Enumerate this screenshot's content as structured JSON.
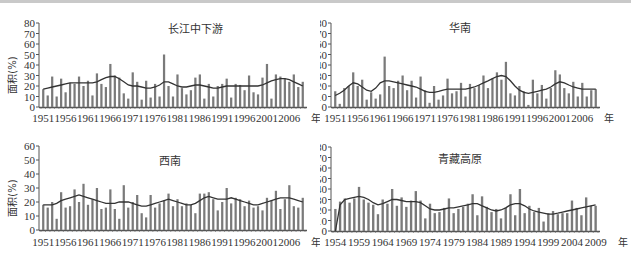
{
  "chart_data": [
    {
      "type": "bar",
      "title": "长江中下游",
      "ylabel": "面积(%)",
      "xlabel_suffix": "年",
      "ylim": [
        0,
        80
      ],
      "yticks": [
        0,
        10,
        20,
        30,
        40,
        50,
        60,
        70,
        80
      ],
      "x_start": 1951,
      "x_end": 2009,
      "xticks": [
        "1951",
        "1956",
        "1961",
        "1966",
        "1971",
        "1976",
        "1981",
        "1986",
        "1991",
        "1996",
        "2001",
        "2006"
      ],
      "values": [
        17,
        11,
        29,
        10,
        27,
        14,
        23,
        22,
        29,
        20,
        25,
        11,
        32,
        22,
        19,
        41,
        30,
        28,
        13,
        8,
        33,
        24,
        7,
        25,
        9,
        22,
        10,
        50,
        20,
        10,
        31,
        18,
        12,
        16,
        28,
        31,
        8,
        22,
        10,
        20,
        22,
        27,
        9,
        22,
        21,
        16,
        30,
        14,
        12,
        28,
        41,
        8,
        31,
        29,
        27,
        24,
        31,
        19,
        24
      ],
      "trend": [
        17,
        18,
        19,
        20,
        21,
        22,
        23,
        23,
        23,
        23,
        23,
        23,
        24,
        26,
        28,
        29,
        29,
        27,
        24,
        21,
        20,
        20,
        19,
        18,
        18,
        19,
        21,
        24,
        24,
        22,
        20,
        19,
        19,
        20,
        21,
        21,
        20,
        19,
        18,
        18,
        19,
        20,
        20,
        20,
        20,
        20,
        20,
        20,
        20,
        21,
        23,
        25,
        26,
        27,
        27,
        26,
        24,
        22,
        20
      ]
    },
    {
      "type": "bar",
      "title": "华南",
      "ylabel": "面积(%)",
      "xlabel_suffix": "年",
      "ylim": [
        0,
        80
      ],
      "yticks": [
        0,
        10,
        20,
        30,
        40,
        50,
        60,
        70,
        80
      ],
      "x_start": 1951,
      "x_end": 2009,
      "xticks": [
        "1951",
        "1956",
        "1961",
        "1966",
        "1971",
        "1976",
        "1981",
        "1986",
        "1991",
        "1996",
        "2001",
        "2006"
      ],
      "values": [
        15,
        3,
        18,
        20,
        33,
        20,
        26,
        7,
        14,
        8,
        12,
        48,
        20,
        18,
        25,
        30,
        16,
        25,
        9,
        29,
        16,
        4,
        20,
        7,
        11,
        27,
        13,
        15,
        23,
        10,
        22,
        18,
        21,
        30,
        18,
        27,
        33,
        26,
        43,
        13,
        11,
        20,
        15,
        2,
        26,
        13,
        21,
        8,
        18,
        35,
        31,
        18,
        13,
        24,
        10,
        23,
        10,
        16,
        17
      ],
      "trend": [
        11,
        13,
        16,
        20,
        23,
        22,
        19,
        16,
        15,
        18,
        23,
        25,
        25,
        24,
        23,
        22,
        21,
        20,
        19,
        17,
        15,
        14,
        14,
        15,
        16,
        17,
        17,
        17,
        17,
        17,
        18,
        19,
        21,
        23,
        25,
        27,
        29,
        30,
        29,
        25,
        20,
        16,
        14,
        13,
        14,
        15,
        16,
        17,
        19,
        22,
        24,
        23,
        21,
        19,
        18,
        17,
        17,
        17,
        17
      ]
    },
    {
      "type": "bar",
      "title": "西南",
      "ylabel": "面积(%)",
      "xlabel_suffix": "年",
      "ylim": [
        0,
        60
      ],
      "yticks": [
        0,
        10,
        20,
        30,
        40,
        50,
        60
      ],
      "x_start": 1951,
      "x_end": 2009,
      "xticks": [
        "1951",
        "1956",
        "1961",
        "1966",
        "1971",
        "1976",
        "1981",
        "1986",
        "1991",
        "1996",
        "2001",
        "2006"
      ],
      "values": [
        18,
        16,
        20,
        8,
        27,
        16,
        17,
        29,
        20,
        33,
        18,
        22,
        30,
        15,
        16,
        29,
        15,
        8,
        32,
        16,
        20,
        25,
        12,
        9,
        25,
        16,
        19,
        21,
        26,
        17,
        22,
        17,
        19,
        18,
        12,
        26,
        26,
        27,
        22,
        14,
        20,
        30,
        19,
        23,
        22,
        17,
        21,
        16,
        17,
        14,
        23,
        21,
        28,
        15,
        22,
        32,
        17,
        16,
        23
      ],
      "trend": [
        18,
        18,
        18,
        19,
        21,
        22,
        23,
        24,
        25,
        24,
        23,
        22,
        21,
        20,
        19,
        19,
        19,
        20,
        20,
        20,
        19,
        18,
        17,
        17,
        18,
        19,
        20,
        21,
        22,
        21,
        20,
        19,
        18,
        18,
        19,
        21,
        23,
        24,
        23,
        22,
        22,
        22,
        23,
        22,
        21,
        20,
        19,
        18,
        18,
        19,
        20,
        21,
        22,
        23,
        23,
        23,
        22,
        21,
        20
      ]
    },
    {
      "type": "bar",
      "title": "青藏高原",
      "ylabel": "面积(%)",
      "xlabel_suffix": "年",
      "ylim": [
        0,
        80
      ],
      "yticks": [
        0,
        10,
        20,
        30,
        40,
        50,
        60,
        70,
        80
      ],
      "x_start": 1954,
      "x_end": 2009,
      "xticks": [
        "1954",
        "1959",
        "1964",
        "1969",
        "1974",
        "1979",
        "1984",
        "1989",
        "1994",
        "1999",
        "2004",
        "2009"
      ],
      "values": [
        21,
        28,
        31,
        27,
        31,
        42,
        30,
        27,
        25,
        16,
        30,
        26,
        40,
        24,
        32,
        23,
        29,
        38,
        29,
        12,
        26,
        17,
        18,
        22,
        31,
        17,
        21,
        23,
        26,
        35,
        15,
        33,
        23,
        18,
        21,
        12,
        22,
        35,
        15,
        40,
        17,
        24,
        18,
        22,
        9,
        17,
        19,
        16,
        17,
        17,
        29,
        22,
        15,
        32,
        24,
        24
      ],
      "trend": [
        0,
        25,
        30,
        31,
        32,
        33,
        32,
        30,
        27,
        25,
        26,
        28,
        30,
        30,
        29,
        28,
        28,
        28,
        27,
        24,
        21,
        20,
        20,
        21,
        22,
        22,
        23,
        24,
        25,
        26,
        26,
        24,
        22,
        20,
        19,
        20,
        22,
        25,
        26,
        26,
        24,
        21,
        19,
        18,
        17,
        16,
        16,
        17,
        18,
        19,
        20,
        21,
        22,
        23,
        24,
        25
      ]
    }
  ]
}
